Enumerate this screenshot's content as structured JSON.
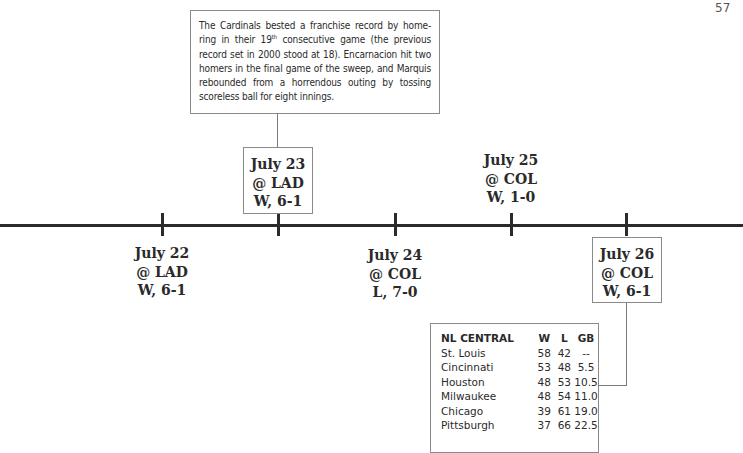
{
  "page_number": "57",
  "note": {
    "text_before_sup": "The Cardinals bested a franchise record by home-ring in their 19",
    "sup": "th",
    "text_after_sup": " consecutive game (the previous record set in 2000 stood at 18). Encarnacion hit two homers in the final game of the sweep, and Marquis rebounded from a horrendous outing by tossing scoreless ball for eight innings."
  },
  "games": [
    {
      "date": "July 22",
      "opponent": "@ LAD",
      "result": "W, 6-1",
      "position": "below",
      "boxed": false
    },
    {
      "date": "July 23",
      "opponent": "@ LAD",
      "result": "W, 6-1",
      "position": "above",
      "boxed": true
    },
    {
      "date": "July 24",
      "opponent": "@ COL",
      "result": "L, 7-0",
      "position": "below",
      "boxed": false
    },
    {
      "date": "July 25",
      "opponent": "@ COL",
      "result": "W, 1-0",
      "position": "above",
      "boxed": false
    },
    {
      "date": "July 26",
      "opponent": "@ COL",
      "result": "W, 6-1",
      "position": "below",
      "boxed": true
    }
  ],
  "standings": {
    "headers": [
      "NL CENTRAL",
      "W",
      "L",
      "GB"
    ],
    "rows": [
      [
        "St. Louis",
        "58",
        "42",
        "--"
      ],
      [
        "Cincinnati",
        "53",
        "48",
        "5.5"
      ],
      [
        "Houston",
        "48",
        "53",
        "10.5"
      ],
      [
        "Milwaukee",
        "48",
        "54",
        "11.0"
      ],
      [
        "Chicago",
        "39",
        "61",
        "19.0"
      ],
      [
        "Pittsburgh",
        "37",
        "66",
        "22.5"
      ]
    ]
  }
}
